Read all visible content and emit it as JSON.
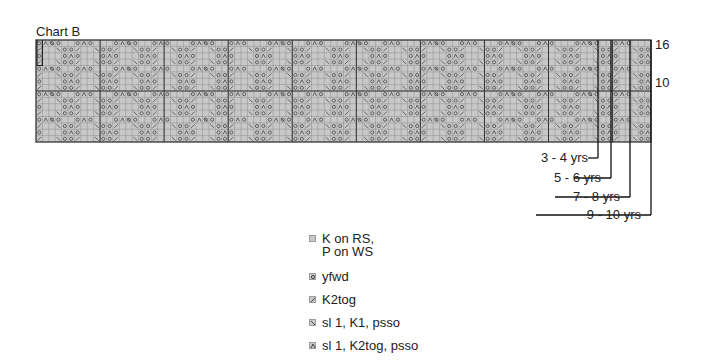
{
  "chart": {
    "title": "Chart B",
    "rows": 16,
    "columns": 96,
    "repeat_width": 6,
    "row_labels": [
      {
        "label": "16",
        "row": 16
      },
      {
        "label": "10",
        "row": 10
      }
    ],
    "colors": {
      "cell_fill": "#c8c8c8",
      "grid_line": "#8c8c8c",
      "major_line": "#333333",
      "symbol": "#333333"
    }
  },
  "sizes": [
    {
      "label": "3 - 4 yrs"
    },
    {
      "label": "5 - 6 yrs"
    },
    {
      "label": "7 - 8 yrs"
    },
    {
      "label": "9 - 10 yrs"
    }
  ],
  "legend": {
    "items": [
      {
        "icon": "plain-square-icon",
        "line1": "K on RS,",
        "line2": "P on WS"
      },
      {
        "icon": "yarn-over-icon",
        "line1": "yfwd"
      },
      {
        "icon": "k2tog-icon",
        "line1": "K2tog"
      },
      {
        "icon": "skpo-icon",
        "line1": "sl 1, K1, psso"
      },
      {
        "icon": "sk2po-icon",
        "line1": "sl 1, K2tog, psso"
      }
    ]
  }
}
